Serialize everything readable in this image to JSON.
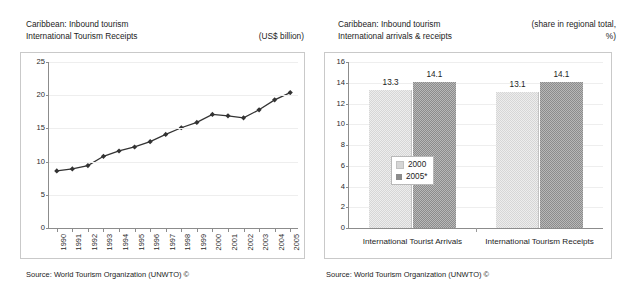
{
  "left_panel": {
    "header_line1": "Caribbean: Inbound tourism",
    "header_line2": "International Tourism Receipts",
    "unit": "(US$ billion)",
    "footer": "Source: World Tourism Organization (UNWTO) ©"
  },
  "right_panel": {
    "header_line1": "Caribbean: Inbound tourism",
    "header_line2": "International arrivals & receipts",
    "unit_line1": "(share in regional total,",
    "unit_line2": "%)",
    "footer": "Source: World Tourism Organization (UNWTO) ©"
  },
  "chart_data": [
    {
      "type": "line",
      "title": "Caribbean: Inbound tourism — International Tourism Receipts",
      "xlabel": "",
      "ylabel": "",
      "unit": "US$ billion",
      "ylim": [
        0,
        25
      ],
      "yticks": [
        0,
        5,
        10,
        15,
        20,
        25
      ],
      "ytick_labels": [
        "0",
        "5",
        "10",
        "15",
        "20",
        "25"
      ],
      "grid": true,
      "legend": "none",
      "marker": "diamond",
      "line_color": "#333333",
      "categories": [
        "1990",
        "1991",
        "1992",
        "1993",
        "1994",
        "1995",
        "1996",
        "1997",
        "1998",
        "1999",
        "2000",
        "2001",
        "2002",
        "2003",
        "2004",
        "2005"
      ],
      "values": [
        8.6,
        8.9,
        9.4,
        10.8,
        11.6,
        12.2,
        13.0,
        14.1,
        15.1,
        15.9,
        17.1,
        16.9,
        16.6,
        17.8,
        19.3,
        20.4
      ]
    },
    {
      "type": "bar",
      "title": "Caribbean: Inbound tourism — International arrivals & receipts",
      "xlabel": "",
      "ylabel": "",
      "unit": "share in regional total, %",
      "ylim": [
        0,
        16
      ],
      "yticks": [
        0,
        2,
        4,
        6,
        8,
        10,
        12,
        14,
        16
      ],
      "ytick_labels": [
        "0",
        "2",
        "4",
        "6",
        "8",
        "10",
        "12",
        "14",
        "16"
      ],
      "grid": true,
      "legend": "inside-left",
      "categories": [
        "International Tourist Arrivals",
        "International Tourism Receipts"
      ],
      "series": [
        {
          "name": "2000",
          "color": "#d6d6d6",
          "values": [
            13.3,
            13.1
          ],
          "labels": [
            "13.3",
            "13.1"
          ]
        },
        {
          "name": "2005*",
          "color": "#8c8c8c",
          "values": [
            14.1,
            14.1
          ],
          "labels": [
            "14.1",
            "14.1"
          ]
        }
      ]
    }
  ]
}
